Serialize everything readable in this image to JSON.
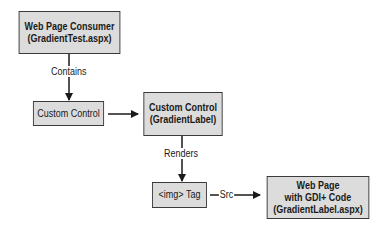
{
  "nodes": {
    "consumer": {
      "line1": "Web Page Consumer",
      "line2": "(GradientTest.aspx)"
    },
    "custom_control": {
      "line1": "Custom Control"
    },
    "gradient_label": {
      "line1": "Custom Control",
      "line2": "(GradientLabel)"
    },
    "img_tag": {
      "line1": "<img> Tag"
    },
    "gdi_page": {
      "line1": "Web Page",
      "line2": "with GDI+ Code",
      "line3": "(GradientLabel.aspx)"
    }
  },
  "edges": {
    "contains": "Contains",
    "renders": "Renders",
    "src": "Src"
  },
  "colors": {
    "box_fill": "#dcdcdc",
    "border": "#3a3a3a",
    "text": "#1a1a1a"
  }
}
